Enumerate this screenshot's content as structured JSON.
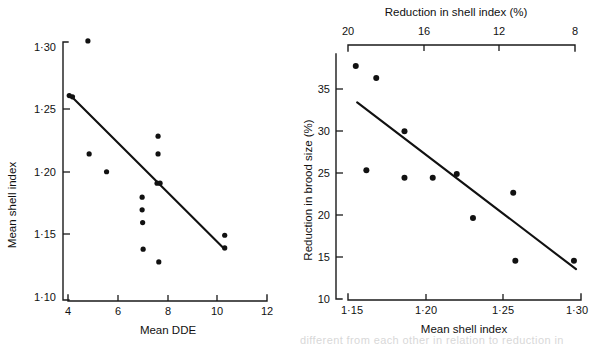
{
  "figure": {
    "background": "#ffffff",
    "ink_color": "#111111",
    "partial_caption": "different from each other in relation to reduction in"
  },
  "chart_data": [
    {
      "id": "left",
      "type": "scatter",
      "title": "",
      "xlabel": "Mean DDE",
      "ylabel": "Mean shell index",
      "xlim": [
        4,
        12
      ],
      "ylim": [
        1.1,
        1.3
      ],
      "xticks": [
        4,
        6,
        8,
        10,
        12
      ],
      "xtick_labels": [
        "4",
        "6",
        "8",
        "10",
        "12"
      ],
      "yticks": [
        1.1,
        1.15,
        1.2,
        1.25,
        1.3
      ],
      "ytick_labels": [
        "1·10",
        "1·15",
        "1·20",
        "1·25",
        "1·30"
      ],
      "grid": false,
      "legend": "none",
      "points": [
        {
          "x": 4.05,
          "y": 1.261
        },
        {
          "x": 4.18,
          "y": 1.26
        },
        {
          "x": 4.8,
          "y": 1.304
        },
        {
          "x": 4.85,
          "y": 1.215
        },
        {
          "x": 5.55,
          "y": 1.201
        },
        {
          "x": 6.98,
          "y": 1.181
        },
        {
          "x": 6.98,
          "y": 1.171
        },
        {
          "x": 7.0,
          "y": 1.161
        },
        {
          "x": 7.02,
          "y": 1.14
        },
        {
          "x": 7.62,
          "y": 1.229
        },
        {
          "x": 7.62,
          "y": 1.215
        },
        {
          "x": 7.58,
          "y": 1.192
        },
        {
          "x": 7.7,
          "y": 1.192
        },
        {
          "x": 7.65,
          "y": 1.13
        },
        {
          "x": 10.3,
          "y": 1.151
        },
        {
          "x": 10.3,
          "y": 1.141
        }
      ],
      "fit_line": {
        "x1": 4.1,
        "y1": 1.261,
        "x2": 10.3,
        "y2": 1.14
      }
    },
    {
      "id": "right",
      "type": "scatter",
      "title": "",
      "xlabel": "Mean shell index",
      "ylabel": "Reduction in brood size (%)",
      "top_axis_label": "Reduction in shell index (%)",
      "xlim": [
        1.14,
        1.305
      ],
      "ylim": [
        10,
        36.5
      ],
      "xticks": [
        1.15,
        1.2,
        1.25,
        1.3
      ],
      "xtick_labels": [
        "1·15",
        "1·20",
        "1·25",
        "1·30"
      ],
      "top_xticks": [
        1.145,
        1.1925,
        1.24,
        1.2875
      ],
      "top_xtick_labels": [
        "20",
        "16",
        "12",
        "8"
      ],
      "yticks": [
        10,
        15,
        20,
        25,
        30,
        35
      ],
      "ytick_labels": [
        "10",
        "15",
        "20",
        "25",
        "30",
        "35"
      ],
      "grid": false,
      "legend": "none",
      "points": [
        {
          "x": 1.1455,
          "y": 35.0
        },
        {
          "x": 1.16,
          "y": 33.7
        },
        {
          "x": 1.18,
          "y": 28.0
        },
        {
          "x": 1.153,
          "y": 23.8
        },
        {
          "x": 1.18,
          "y": 23.0
        },
        {
          "x": 1.2,
          "y": 23.0
        },
        {
          "x": 1.217,
          "y": 23.4
        },
        {
          "x": 1.2285,
          "y": 18.7
        },
        {
          "x": 1.257,
          "y": 21.4
        },
        {
          "x": 1.2585,
          "y": 14.1
        },
        {
          "x": 1.3,
          "y": 14.1
        }
      ],
      "fit_line": {
        "x1": 1.1465,
        "y1": 31.1,
        "x2": 1.3015,
        "y2": 13.2
      }
    }
  ]
}
